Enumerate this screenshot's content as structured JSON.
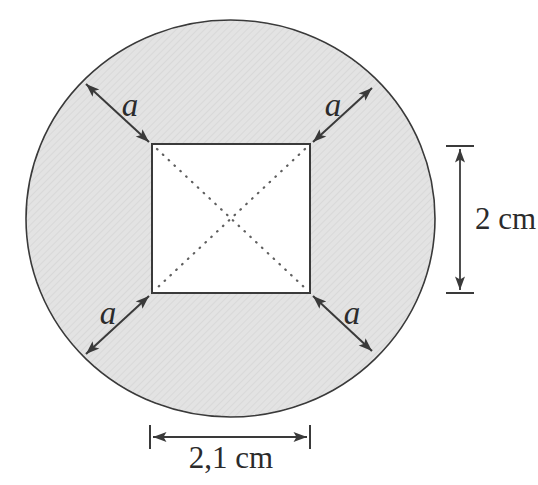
{
  "figure": {
    "type": "geometry-diagram",
    "labels": {
      "a_top_left": "a",
      "a_top_right": "a",
      "a_bottom_left": "a",
      "a_bottom_right": "a",
      "height_dim": "2 cm",
      "width_dim": "2,1 cm"
    },
    "colors": {
      "background": "#ffffff",
      "circle_fill": "#e3e3e3",
      "circle_texture": "#d2d2d2",
      "square_fill": "#ffffff",
      "line": "#3a3a3a",
      "dots": "#5f5f5f",
      "text": "#2b2b2b"
    }
  }
}
